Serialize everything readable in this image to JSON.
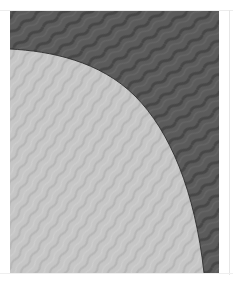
{
  "product_image": {
    "alt": "Moire fabric swatch",
    "subject": "fabric-swatch-moire",
    "colors": {
      "dark_fabric": "#5b5b5b",
      "dark_fabric_wave": "#474747",
      "light_fabric": "#c6c6c6",
      "light_fabric_wave": "#b5b5b5",
      "edge_line": "#2e2e2e",
      "page_background": "#ffffff"
    }
  }
}
